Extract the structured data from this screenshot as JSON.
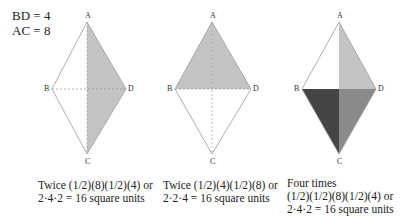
{
  "given": {
    "line1": "BD = 4",
    "line2": "AC = 8"
  },
  "vertices": {
    "a": "A",
    "b": "B",
    "c": "C",
    "d": "D"
  },
  "colors": {
    "outline": "#9a9a9a",
    "light_shade": "#c4c4c4",
    "mid_shade": "#8a8a8a",
    "dark_shade": "#444444"
  },
  "figures": [
    {
      "caption_line1": "Twice (1/2)(8)(1/2)(4) or",
      "caption_line2": "2·4·2 = 16 square units"
    },
    {
      "caption_line1": "Twice (1/2)(4)(1/2)(8) or",
      "caption_line2": "2·2·4 = 16 square units"
    },
    {
      "caption_line1": "Four times",
      "caption_line2": "(1/2)(1/2)(8)(1/2)(4) or",
      "caption_line3": "2·4·2 = 16 square units"
    }
  ]
}
